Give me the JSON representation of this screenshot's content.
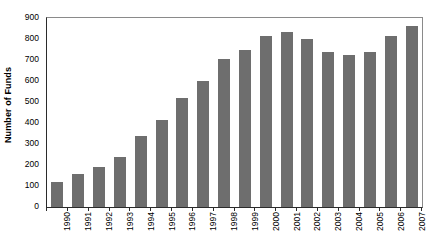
{
  "chart_data": {
    "type": "bar",
    "title": "",
    "subtitle": "",
    "xlabel": "",
    "ylabel": "Number of Funds",
    "categories": [
      "1990",
      "1991",
      "1992",
      "1993",
      "1994",
      "1995",
      "1996",
      "1997",
      "1998",
      "1999",
      "2000",
      "2001",
      "2002",
      "2003",
      "2004",
      "2005",
      "2006",
      "2007"
    ],
    "values": [
      120,
      155,
      190,
      240,
      340,
      415,
      520,
      600,
      705,
      750,
      815,
      835,
      800,
      740,
      725,
      740,
      815,
      860
    ],
    "ylim": [
      0,
      900
    ],
    "ytick_step": 100,
    "yticks": [
      "0",
      "100",
      "200",
      "300",
      "400",
      "500",
      "600",
      "700",
      "800",
      "900"
    ],
    "grid": false,
    "legend": false,
    "legend_position": "none",
    "bar_color": "#6e6e6e",
    "axis_color": "#2b2b2b",
    "plot_background": "#ffffff",
    "xtick_rotation": "-90",
    "annotations": []
  }
}
